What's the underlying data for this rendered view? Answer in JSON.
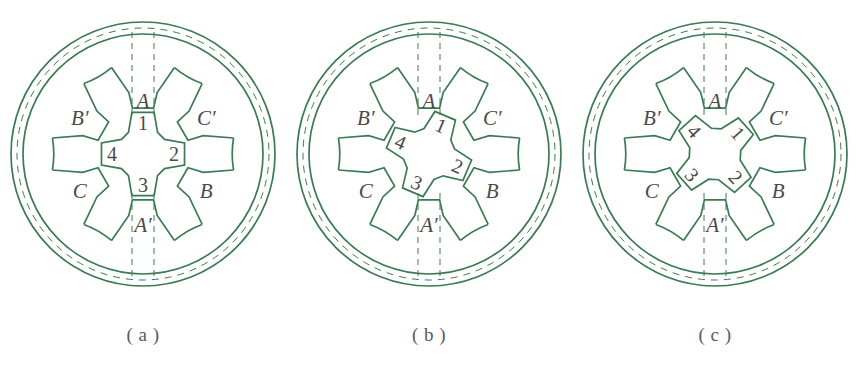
{
  "figure": {
    "line_color": "#3b7a52",
    "label_color": "#4a4a4a",
    "caption_color": "#5a5a5a",
    "background": "#ffffff"
  },
  "panels": [
    {
      "caption": "( a )",
      "rotor_angle": 0,
      "stator_labels": [
        {
          "text": "A",
          "angle_deg": 90
        },
        {
          "text": "C′",
          "angle_deg": 30
        },
        {
          "text": "B",
          "angle_deg": -30
        },
        {
          "text": "A′",
          "angle_deg": -90
        },
        {
          "text": "C",
          "angle_deg": -150
        },
        {
          "text": "B′",
          "angle_deg": 150
        }
      ],
      "rotor_labels": [
        {
          "text": "1",
          "angle_deg": 90
        },
        {
          "text": "2",
          "angle_deg": 0
        },
        {
          "text": "3",
          "angle_deg": -90
        },
        {
          "text": "4",
          "angle_deg": 180
        }
      ]
    },
    {
      "caption": "( b )",
      "rotor_angle": -23,
      "stator_labels": [
        {
          "text": "A",
          "angle_deg": 90
        },
        {
          "text": "C′",
          "angle_deg": 30
        },
        {
          "text": "B",
          "angle_deg": -30
        },
        {
          "text": "A′",
          "angle_deg": -90
        },
        {
          "text": "C",
          "angle_deg": -150
        },
        {
          "text": "B′",
          "angle_deg": 150
        }
      ],
      "rotor_labels": [
        {
          "text": "1",
          "angle_deg": 90
        },
        {
          "text": "2",
          "angle_deg": 0
        },
        {
          "text": "3",
          "angle_deg": -90
        },
        {
          "text": "4",
          "angle_deg": 180
        }
      ]
    },
    {
      "caption": "( c )",
      "rotor_angle": -48,
      "stator_labels": [
        {
          "text": "A",
          "angle_deg": 90
        },
        {
          "text": "C′",
          "angle_deg": 30
        },
        {
          "text": "B",
          "angle_deg": -30
        },
        {
          "text": "A′",
          "angle_deg": -90
        },
        {
          "text": "C",
          "angle_deg": -150
        },
        {
          "text": "B′",
          "angle_deg": 150
        }
      ],
      "rotor_labels": [
        {
          "text": "1",
          "angle_deg": 90
        },
        {
          "text": "2",
          "angle_deg": 0
        },
        {
          "text": "3",
          "angle_deg": -90
        },
        {
          "text": "4",
          "angle_deg": 180
        }
      ]
    }
  ]
}
